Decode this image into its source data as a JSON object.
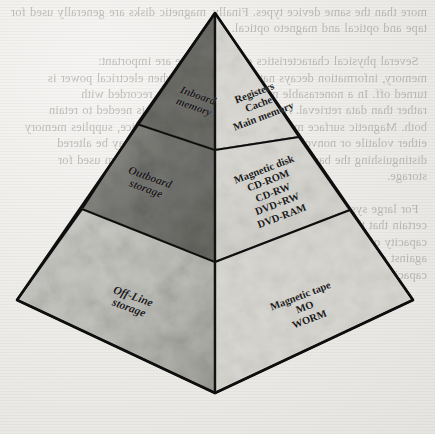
{
  "figure": {
    "type": "memory-hierarchy-pyramid",
    "shape": "pyramid",
    "faces": 2,
    "tiers": 3
  },
  "colors": {
    "left_face_tier1": "#6e6e6e",
    "left_face_tier2": "#7f7f7f",
    "left_face_tier3": "#c6c6c2",
    "right_face_tier1": "#d8d7d2",
    "right_face_tier2": "#d2d1cc",
    "right_face_tier3": "#d6d5d0",
    "outline": "#121212",
    "paper": "#ecebe8",
    "text": "#1a1a1a"
  },
  "pyramid": {
    "left_face": {
      "name": "left-face",
      "tiers": [
        {
          "id": "inboard",
          "label_lines": [
            "Inboard",
            "memory"
          ]
        },
        {
          "id": "outboard",
          "label_lines": [
            "Outboard",
            "storage"
          ]
        },
        {
          "id": "offline",
          "label_lines": [
            "Off-Line",
            "storage"
          ]
        }
      ]
    },
    "right_face": {
      "name": "right-face",
      "tiers": [
        {
          "id": "tier-1",
          "label_lines": [
            "Registers",
            "Cache",
            "Main memory"
          ]
        },
        {
          "id": "tier-2",
          "label_lines": [
            "Magnetic disk",
            "CD-ROM",
            "CD-RW",
            "DVD+RW",
            "DVD-RAM"
          ]
        },
        {
          "id": "tier-3",
          "label_lines": [
            "Magnetic tape",
            "MO",
            "WORM"
          ]
        }
      ]
    }
  },
  "background": {
    "description": "faint mirrored bleed-through text from reverse side of scanned book page",
    "bleed_text": "more than the same device types. Finally, magnetic disks are generally used for\ntape and optical and magneto optical.\n\n  Several physical characteristics of data storage are important:\nmemory, information decays naturally or is lost when electrical power is\nturned off. In a nonerasable memory, information is recorded with\nrather than data retrieval. A relevant physical process is needed to retain\nboth. Magnetic surface memories, as in the rotating device, supplies memory\neither volatile or nonvolatile. A semiconductor memory may be altered\ndistinguishing the basic forms is the type of physical medium used for\nstorage.\n\n  For large systems, the design of a memory system involves the\ncertain that the main memory of the machine is large enough. The\ncapacity of a memory and the time to access it must be balanced\nagainst cost, which rises steeply with faster access times and larger\ncapacities, a hierarchy of memory technologies is used."
  }
}
